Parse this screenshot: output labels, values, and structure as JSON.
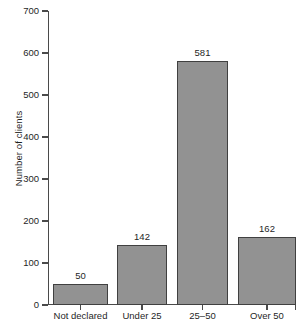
{
  "chart_data": {
    "type": "bar",
    "title": "",
    "xlabel": "",
    "ylabel": "Number of clients",
    "categories": [
      "Not declared",
      "Under 25",
      "25–50",
      "Over 50"
    ],
    "values": [
      50,
      142,
      581,
      162
    ],
    "value_labels": [
      "50",
      "142",
      "581",
      "162"
    ],
    "ylim": [
      0,
      700
    ],
    "ytick_labels": [
      "0",
      "100",
      "200",
      "300",
      "400",
      "500",
      "600",
      "700"
    ],
    "ytick_values": [
      0,
      100,
      200,
      300,
      400,
      500,
      600,
      700
    ],
    "grid": false,
    "legend": "none",
    "bar_color": "#929292",
    "bar_border_color": "#404040",
    "axis_color": "#4a4a4a",
    "text_color": "#1f1f1f",
    "background_color": "#ffffff"
  }
}
